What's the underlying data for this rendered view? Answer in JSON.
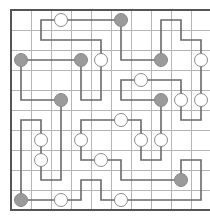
{
  "puzzle": {
    "type": "Masyu",
    "rows": 10,
    "cols": 10,
    "origin": {
      "x": 11,
      "y": 10
    },
    "cell_size": 20,
    "colors": {
      "background": "#ffffff",
      "grid_line": "#b5b5b5",
      "border": "#555555",
      "path": "#6a6a6a",
      "black_circle_fill": "#9a9a9a",
      "black_circle_stroke": "#8a8a8a",
      "white_circle_fill": "#ffffff",
      "white_circle_stroke": "#8a8a8a"
    },
    "black_circles": [
      [
        5,
        0
      ],
      [
        0,
        2
      ],
      [
        3,
        2
      ],
      [
        7,
        2
      ],
      [
        2,
        4
      ],
      [
        7,
        4
      ],
      [
        8,
        8
      ],
      [
        0,
        9
      ]
    ],
    "white_circles": [
      [
        2,
        0
      ],
      [
        4,
        2
      ],
      [
        9,
        2
      ],
      [
        6,
        3
      ],
      [
        8,
        4
      ],
      [
        9,
        4
      ],
      [
        5,
        5
      ],
      [
        1,
        6
      ],
      [
        3,
        6
      ],
      [
        6,
        6
      ],
      [
        7,
        6
      ],
      [
        1,
        7
      ],
      [
        4,
        7
      ],
      [
        2,
        9
      ],
      [
        5,
        9
      ]
    ],
    "loop": [
      [
        5,
        0
      ],
      [
        1,
        0
      ],
      [
        1,
        1
      ],
      [
        4,
        1
      ],
      [
        4,
        4
      ],
      [
        3,
        4
      ],
      [
        3,
        2
      ],
      [
        0,
        2
      ],
      [
        0,
        4
      ],
      [
        2,
        4
      ],
      [
        2,
        8
      ],
      [
        1,
        8
      ],
      [
        1,
        5
      ],
      [
        0,
        5
      ],
      [
        0,
        9
      ],
      [
        3,
        9
      ],
      [
        3,
        8
      ],
      [
        4,
        8
      ],
      [
        4,
        9
      ],
      [
        9,
        9
      ],
      [
        9,
        7
      ],
      [
        8,
        7
      ],
      [
        8,
        8
      ],
      [
        5,
        8
      ],
      [
        5,
        7
      ],
      [
        3,
        7
      ],
      [
        3,
        5
      ],
      [
        6,
        5
      ],
      [
        6,
        7
      ],
      [
        7,
        7
      ],
      [
        7,
        4
      ],
      [
        5,
        4
      ],
      [
        5,
        3
      ],
      [
        8,
        3
      ],
      [
        8,
        5
      ],
      [
        9,
        5
      ],
      [
        9,
        1
      ],
      [
        8,
        1
      ],
      [
        8,
        0
      ],
      [
        7,
        0
      ],
      [
        7,
        2
      ],
      [
        5,
        2
      ],
      [
        5,
        0
      ]
    ]
  }
}
